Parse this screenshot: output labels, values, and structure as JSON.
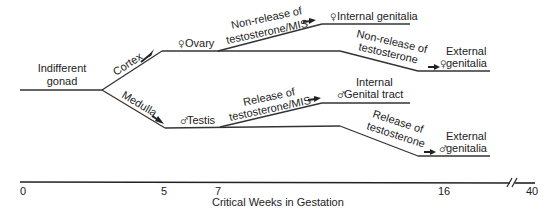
{
  "diagram": {
    "start_node": {
      "line1": "Indifferent",
      "line2": "gonad"
    },
    "branches": {
      "cortex": "Cortex",
      "medulla": "Medulla"
    },
    "ovary": {
      "symbol": "♀",
      "label": "Ovary"
    },
    "testis": {
      "symbol": "♂",
      "label": "Testis"
    },
    "female_internal": {
      "process_line1": "Non-release of",
      "process_line2": "testosterone/MIS",
      "symbol": "♀",
      "label": "Internal genitalia"
    },
    "female_external": {
      "process_line1": "Non-release of",
      "process_line2": "testosterone",
      "symbol": "♀",
      "label_line1": "External",
      "label_line2": "genitalia"
    },
    "male_internal": {
      "process_line1": "Release of",
      "process_line2": "testosterone/MIS",
      "symbol": "♂",
      "label_line1": "Internal",
      "label_line2": "Genital tract"
    },
    "male_external": {
      "process_line1": "Release of",
      "process_line2": "testosterone",
      "symbol": "♂",
      "label_line1": "External",
      "label_line2": "genitalia"
    }
  },
  "axis": {
    "title": "Critical Weeks in Gestation",
    "ticks": [
      "0",
      "5",
      "7",
      "16",
      "40"
    ],
    "break_marker": "//"
  }
}
